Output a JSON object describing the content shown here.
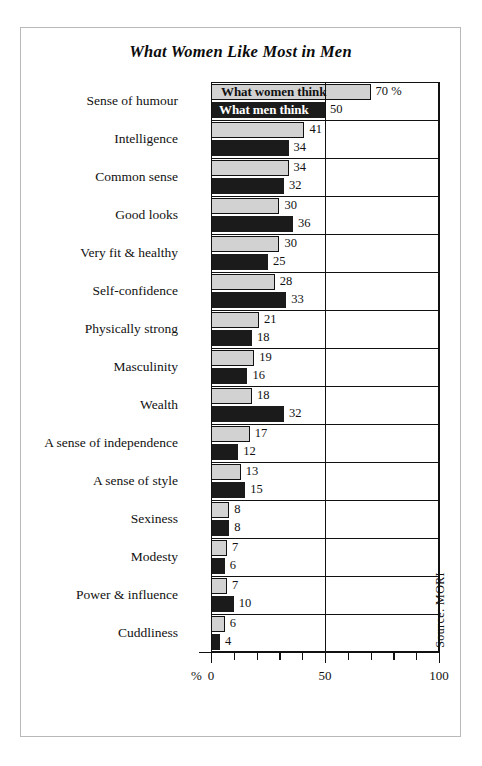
{
  "title": "What Women Like Most in Men",
  "source": "Source: MORI",
  "axis": {
    "percent_symbol": "%",
    "ticks": [
      0,
      10,
      20,
      30,
      40,
      50,
      60,
      70,
      80,
      90,
      100
    ],
    "labeled_ticks": [
      {
        "value": 0,
        "label": "0"
      },
      {
        "value": 50,
        "label": "50"
      },
      {
        "value": 100,
        "label": "100"
      }
    ],
    "xlim": [
      0,
      100
    ],
    "gridlines": [
      50,
      100
    ]
  },
  "legend": {
    "women_label": "What women think",
    "men_label": "What men think",
    "women_color": "#d2d2d2",
    "men_color": "#1b1b1b"
  },
  "first_row_unit": "70 %",
  "chart_data": {
    "type": "bar",
    "title": "What Women Like Most in Men",
    "xlabel": "%",
    "ylabel": "",
    "xlim": [
      0,
      100
    ],
    "grid": true,
    "legend_position": "inside-first-bars",
    "orientation": "horizontal",
    "categories": [
      "Sense of humour",
      "Intelligence",
      "Common sense",
      "Good looks",
      "Very fit & healthy",
      "Self-confidence",
      "Physically strong",
      "Masculinity",
      "Wealth",
      "A sense of independence",
      "A sense of style",
      "Sexiness",
      "Modesty",
      "Power & influence",
      "Cuddliness"
    ],
    "series": [
      {
        "name": "What women think",
        "color": "#d2d2d2",
        "values": [
          70,
          41,
          34,
          30,
          30,
          28,
          21,
          19,
          18,
          17,
          13,
          8,
          7,
          7,
          6
        ],
        "labels": [
          "70 %",
          "41",
          "34",
          "30",
          "30",
          "28",
          "21",
          "19",
          "18",
          "17",
          "13",
          "8",
          "7",
          "7",
          "6"
        ]
      },
      {
        "name": "What men think",
        "color": "#1b1b1b",
        "values": [
          50,
          34,
          32,
          36,
          25,
          33,
          18,
          16,
          32,
          12,
          15,
          8,
          6,
          10,
          4
        ],
        "labels": [
          "50",
          "34",
          "32",
          "36",
          "25",
          "33",
          "18",
          "16",
          "32",
          "12",
          "15",
          "8",
          "6",
          "10",
          "4"
        ]
      }
    ],
    "annotations": [
      "Source: MORI"
    ]
  }
}
